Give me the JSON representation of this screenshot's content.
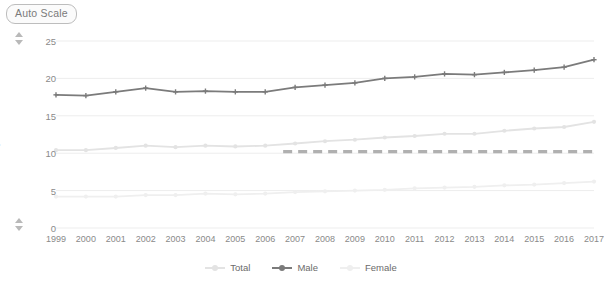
{
  "toolbar": {
    "auto_scale_label": "Auto Scale"
  },
  "controls": {
    "top_spinner_up": "increase-max-icon",
    "top_spinner_down": "decrease-max-icon",
    "bottom_spinner_up": "increase-min-icon",
    "bottom_spinner_down": "decrease-min-icon"
  },
  "colors": {
    "total": "#e3e3e3",
    "male": "#7b7b7b",
    "female": "#efefef",
    "reference": "#b0b0b0",
    "grid": "#ededed",
    "axis_text": "#8a8a8a"
  },
  "chart_data": {
    "type": "line",
    "title": "",
    "xlabel": "",
    "ylabel": "per 100,000",
    "ylim": [
      0,
      25
    ],
    "yticks": [
      0,
      5,
      10,
      15,
      20,
      25
    ],
    "grid": true,
    "legend_position": "bottom",
    "x": [
      1999,
      2000,
      2001,
      2002,
      2003,
      2004,
      2005,
      2006,
      2007,
      2008,
      2009,
      2010,
      2011,
      2012,
      2013,
      2014,
      2015,
      2016,
      2017
    ],
    "categories": [
      "1999",
      "2000",
      "2001",
      "2002",
      "2003",
      "2004",
      "2005",
      "2006",
      "2007",
      "2008",
      "2009",
      "2010",
      "2011",
      "2012",
      "2013",
      "2014",
      "2015",
      "2016",
      "2017"
    ],
    "series": [
      {
        "name": "Total",
        "color": "#e3e3e3",
        "marker": "circle",
        "values": [
          10.4,
          10.4,
          10.7,
          11.0,
          10.8,
          11.0,
          10.9,
          11.0,
          11.3,
          11.6,
          11.8,
          12.1,
          12.3,
          12.6,
          12.6,
          13.0,
          13.3,
          13.5,
          14.2
        ]
      },
      {
        "name": "Male",
        "color": "#7b7b7b",
        "marker": "plus",
        "values": [
          17.8,
          17.7,
          18.2,
          18.7,
          18.2,
          18.3,
          18.2,
          18.2,
          18.8,
          19.1,
          19.4,
          20.0,
          20.2,
          20.6,
          20.5,
          20.8,
          21.1,
          21.5,
          22.5
        ]
      },
      {
        "name": "Female",
        "color": "#efefef",
        "marker": "circle",
        "values": [
          4.2,
          4.2,
          4.2,
          4.4,
          4.4,
          4.6,
          4.5,
          4.6,
          4.8,
          4.9,
          5.0,
          5.1,
          5.3,
          5.4,
          5.5,
          5.7,
          5.8,
          6.0,
          6.2
        ]
      }
    ],
    "annotations": [
      {
        "type": "reference-line",
        "style": "dashed",
        "color": "#b0b0b0",
        "value": 10.2,
        "x_start": 2006.6,
        "x_end": 2017
      }
    ],
    "legend": [
      {
        "label": "Total",
        "color": "#e3e3e3"
      },
      {
        "label": "Male",
        "color": "#7b7b7b"
      },
      {
        "label": "Female",
        "color": "#efefef"
      }
    ]
  }
}
